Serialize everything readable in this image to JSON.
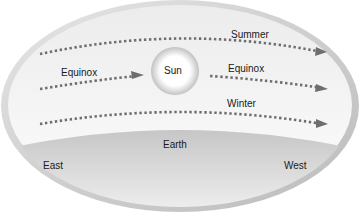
{
  "diagram": {
    "sun": {
      "label": "Sun"
    },
    "paths": [
      {
        "label": "Summer"
      },
      {
        "label": "Equinox",
        "label_left": "Equinox"
      },
      {
        "label": "Winter"
      }
    ],
    "earth": {
      "label": "Earth"
    },
    "directions": {
      "east": "East",
      "west": "West"
    },
    "colors": {
      "dome_rim": "#c8c8c8",
      "dome_fill": "#f2f2f2",
      "ground": "#d4d4d4",
      "arrow": "#6e6e6e",
      "sun_glow": "#bdbdbd"
    }
  }
}
